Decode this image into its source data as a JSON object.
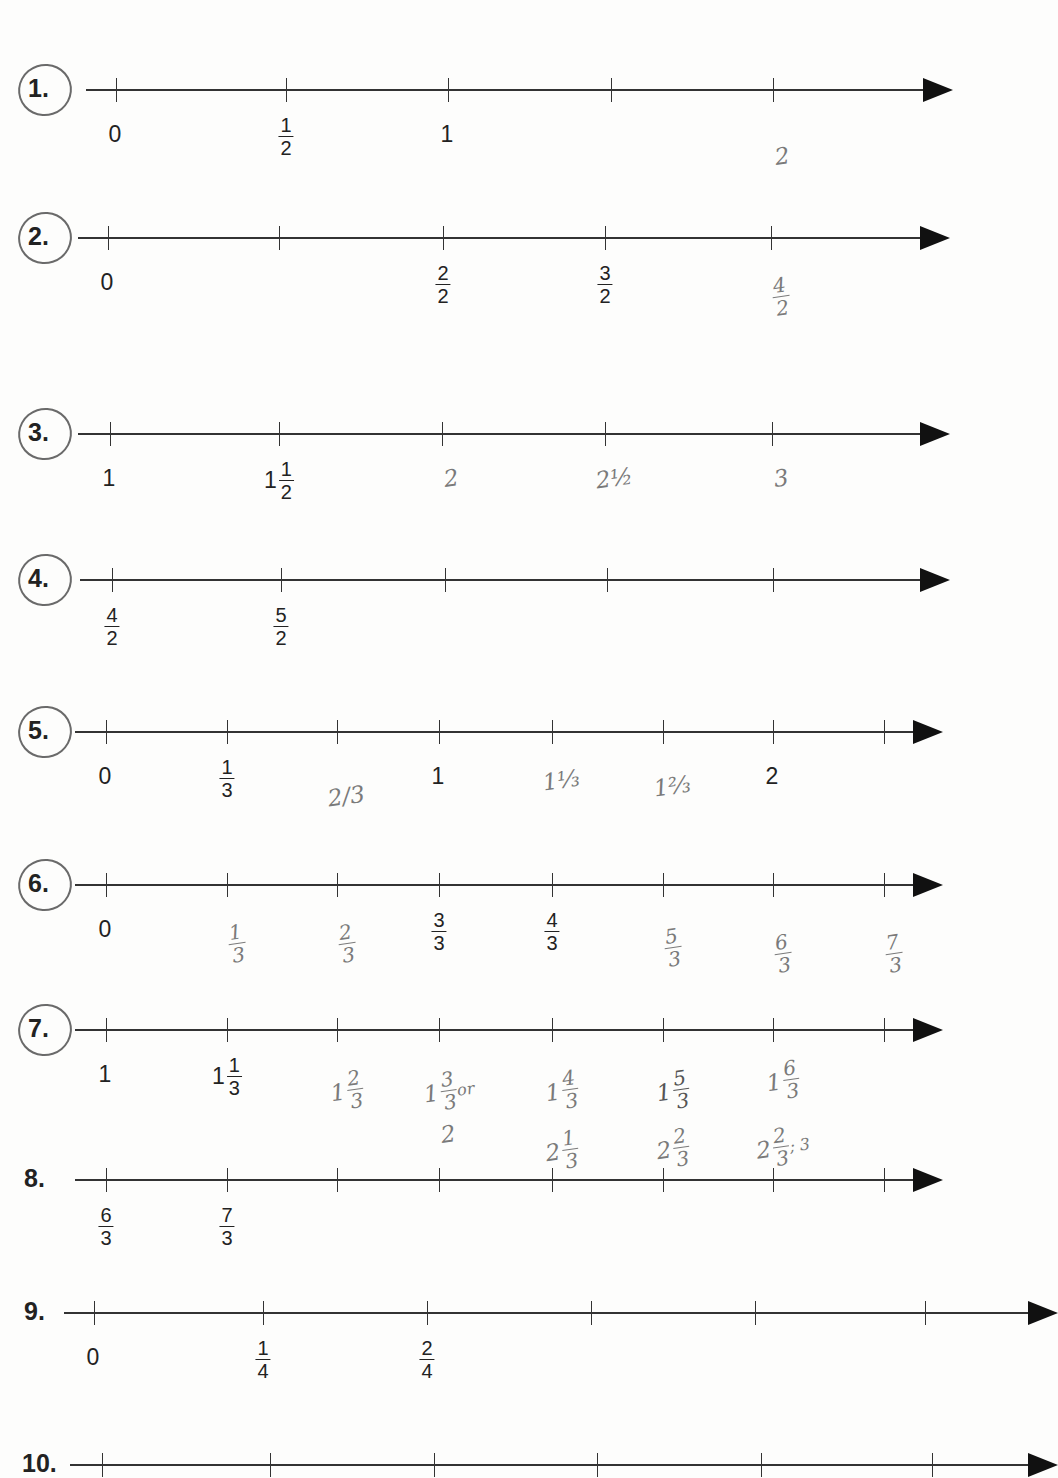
{
  "worksheet": {
    "problems": [
      {
        "number": "1.",
        "circled": true,
        "y": 90,
        "x_start": 86,
        "x_end": 925,
        "ticks": [
          116,
          286,
          448,
          611,
          773
        ],
        "printed_labels": [
          {
            "tick": 0,
            "whole": "0"
          },
          {
            "tick": 1,
            "num": "1",
            "den": "2"
          },
          {
            "tick": 2,
            "whole": "1"
          }
        ],
        "handwritten_labels": [
          {
            "tick": 4,
            "whole": "2",
            "dy": 62
          }
        ]
      },
      {
        "number": "2.",
        "circled": true,
        "y": 238,
        "x_start": 78,
        "x_end": 922,
        "ticks": [
          108,
          279,
          443,
          605,
          771
        ],
        "printed_labels": [
          {
            "tick": 0,
            "whole": "0"
          },
          {
            "tick": 2,
            "num": "2",
            "den": "2"
          },
          {
            "tick": 3,
            "num": "3",
            "den": "2"
          }
        ],
        "handwritten_labels": [
          {
            "tick": 4,
            "num": "4",
            "den": "2",
            "dy": 48
          }
        ]
      },
      {
        "number": "3.",
        "circled": true,
        "y": 434,
        "x_start": 78,
        "x_end": 922,
        "ticks": [
          110,
          279,
          442,
          605,
          772
        ],
        "printed_labels": [
          {
            "tick": 0,
            "whole": "1"
          },
          {
            "tick": 1,
            "whole": "1",
            "num": "1",
            "den": "2"
          }
        ],
        "handwritten_labels": [
          {
            "tick": 2,
            "whole": "2",
            "dy": 40
          },
          {
            "tick": 3,
            "whole": "2½",
            "dy": 40
          },
          {
            "tick": 4,
            "whole": "3",
            "dy": 40
          }
        ]
      },
      {
        "number": "4.",
        "circled": true,
        "y": 580,
        "x_start": 80,
        "x_end": 922,
        "ticks": [
          112,
          281,
          445,
          607,
          773
        ],
        "printed_labels": [
          {
            "tick": 0,
            "num": "4",
            "den": "2"
          },
          {
            "tick": 1,
            "num": "5",
            "den": "2"
          }
        ],
        "handwritten_labels": []
      },
      {
        "number": "5.",
        "circled": true,
        "y": 732,
        "x_start": 75,
        "x_end": 915,
        "ticks": [
          106,
          227,
          337,
          439,
          552,
          663,
          773,
          884
        ],
        "printed_labels": [
          {
            "tick": 0,
            "whole": "0"
          },
          {
            "tick": 1,
            "num": "1",
            "den": "3"
          },
          {
            "tick": 3,
            "whole": "1"
          },
          {
            "tick": 6,
            "whole": "2"
          }
        ],
        "handwritten_labels": [
          {
            "tick": 2,
            "whole": "2/3",
            "dy": 60
          },
          {
            "tick": 4,
            "whole": "1⅓",
            "dy": 44
          },
          {
            "tick": 5,
            "whole": "1⅔",
            "dy": 50
          }
        ]
      },
      {
        "number": "6.",
        "circled": true,
        "y": 885,
        "x_start": 75,
        "x_end": 915,
        "ticks": [
          106,
          227,
          337,
          439,
          552,
          663,
          773,
          884
        ],
        "printed_labels": [
          {
            "tick": 0,
            "whole": "0"
          },
          {
            "tick": 3,
            "num": "3",
            "den": "3"
          },
          {
            "tick": 4,
            "num": "4",
            "den": "3"
          }
        ],
        "handwritten_labels": [
          {
            "tick": 1,
            "num": "1",
            "den": "3",
            "dy": 48
          },
          {
            "tick": 2,
            "num": "2",
            "den": "3",
            "dy": 48
          },
          {
            "tick": 5,
            "num": "5",
            "den": "3",
            "dy": 52
          },
          {
            "tick": 6,
            "num": "6",
            "den": "3",
            "dy": 58
          },
          {
            "tick": 7,
            "num": "7",
            "den": "3",
            "dy": 58
          }
        ]
      },
      {
        "number": "7.",
        "circled": true,
        "y": 1030,
        "x_start": 75,
        "x_end": 915,
        "ticks": [
          106,
          227,
          337,
          439,
          552,
          663,
          773,
          884
        ],
        "printed_labels": [
          {
            "tick": 0,
            "whole": "1"
          },
          {
            "tick": 1,
            "whole": "1",
            "num": "1",
            "den": "3"
          }
        ],
        "handwritten_labels": [
          {
            "tick": 2,
            "whole": "1",
            "num": "2",
            "den": "3",
            "dy": 50
          },
          {
            "tick": 3,
            "whole": "1",
            "num": "3",
            "den": "3",
            "suffix": "or",
            "dy": 50
          },
          {
            "tick": 3,
            "whole": "2",
            "dy": 100
          },
          {
            "tick": 4,
            "whole": "1",
            "num": "4",
            "den": "3",
            "dy": 50
          },
          {
            "tick": 4,
            "whole": "2",
            "num": "1",
            "den": "3",
            "dy": 110
          },
          {
            "tick": 5,
            "whole": "1",
            "num": "5",
            "den": "3",
            "dy": 50,
            "dark": true
          },
          {
            "tick": 5,
            "whole": "2",
            "num": "2",
            "den": "3",
            "dy": 108
          },
          {
            "tick": 6,
            "whole": "1",
            "num": "6",
            "den": "3",
            "dy": 40
          },
          {
            "tick": 6,
            "whole": "2",
            "num": "2",
            "den": "3",
            "suffix": "; 3",
            "dy": 106
          }
        ]
      },
      {
        "number": "8.",
        "circled": false,
        "y": 1180,
        "x_start": 75,
        "x_end": 915,
        "ticks": [
          106,
          227,
          337,
          439,
          552,
          663,
          773,
          884
        ],
        "printed_labels": [
          {
            "tick": 0,
            "num": "6",
            "den": "3"
          },
          {
            "tick": 1,
            "num": "7",
            "den": "3"
          }
        ],
        "handwritten_labels": []
      },
      {
        "number": "9.",
        "circled": false,
        "y": 1313,
        "x_start": 64,
        "x_end": 1030,
        "ticks": [
          94,
          263,
          427,
          591,
          755,
          925
        ],
        "printed_labels": [
          {
            "tick": 0,
            "whole": "0"
          },
          {
            "tick": 1,
            "num": "1",
            "den": "4"
          },
          {
            "tick": 2,
            "num": "2",
            "den": "4"
          }
        ],
        "handwritten_labels": []
      },
      {
        "number": "10.",
        "circled": false,
        "y": 1465,
        "x_start": 70,
        "x_end": 1030,
        "ticks": [
          102,
          270,
          434,
          597,
          761,
          932
        ],
        "printed_labels": [],
        "handwritten_labels": []
      }
    ]
  }
}
